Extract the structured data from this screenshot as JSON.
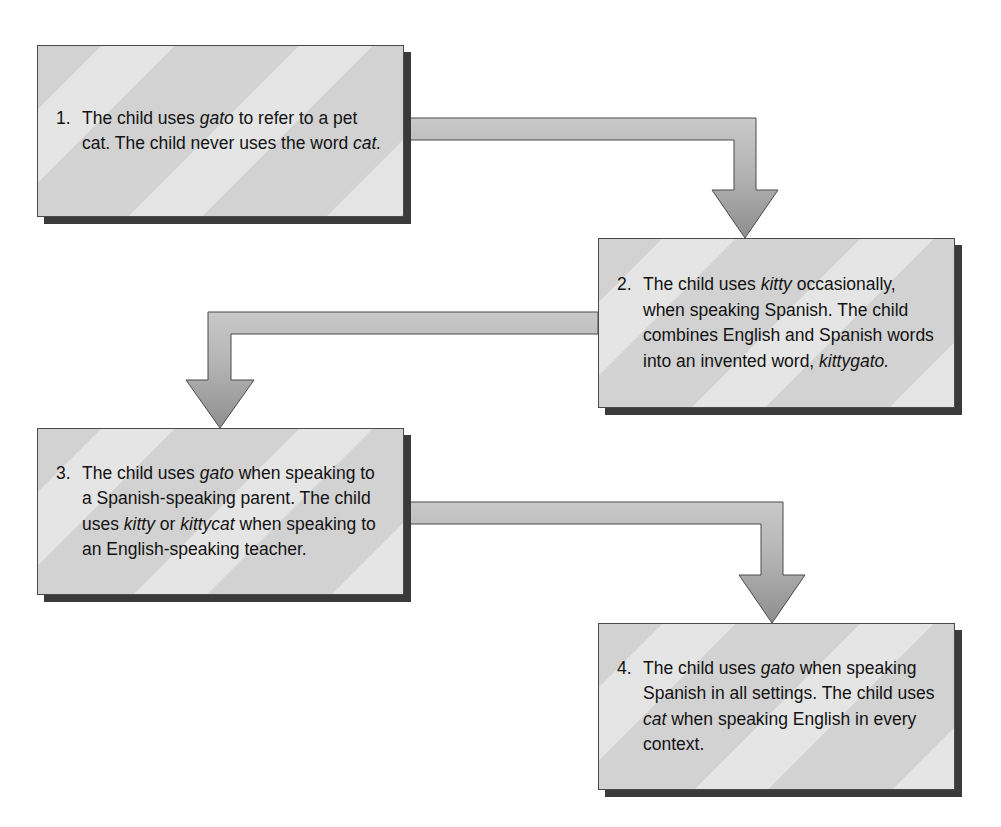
{
  "diagram": {
    "type": "linear-flowchart",
    "direction": "top-left to bottom-right, serpentine",
    "colors": {
      "box_fill": "#d2d2d2",
      "box_stripe_light": "#e4e4e4",
      "box_border": "#4a4a4a",
      "box_shadow": "#3a3a3a",
      "arrow_fill_light": "#d0d0d0",
      "arrow_fill_dark": "#9a9a9a",
      "arrow_border": "#4a4a4a",
      "text": "#121212",
      "background": "#ffffff"
    },
    "steps": [
      {
        "number": "1.",
        "text_plain": "The child uses gato to refer to a pet cat. The child never uses the word cat.",
        "text_html": "The child uses <em>gato</em> to refer to a pet cat. The child never uses the word <em>cat.</em>"
      },
      {
        "number": "2.",
        "text_plain": "The child uses kitty occasionally, when speaking Spanish. The child combines English and Spanish words into an invented word, kittygato.",
        "text_html": "The child uses <em>kitty</em> occasionally, when speaking Spanish. The child combines English and Spanish words into an invented word, <em>kittygato.</em>"
      },
      {
        "number": "3.",
        "text_plain": "The child uses gato when speaking to a Spanish-speaking parent. The child uses kitty or kittycat when speaking to an English-speaking teacher.",
        "text_html": "The child uses <em>gato</em> when speaking to a Spanish-speaking parent. The child uses <em>kitty</em> or <em>kittycat</em> when speaking to an English-speaking teacher."
      },
      {
        "number": "4.",
        "text_plain": "The child uses gato when speaking Spanish in all settings. The child uses cat when speaking English in every context.",
        "text_html": "The child uses <em>gato</em> when speaking Spanish in all settings. The child uses <em>cat</em> when speaking English in every context."
      }
    ],
    "connectors": [
      {
        "from": "1",
        "to": "2",
        "shape": "right-then-down",
        "arrowhead": "down"
      },
      {
        "from": "2",
        "to": "3",
        "shape": "left-then-down",
        "arrowhead": "down"
      },
      {
        "from": "3",
        "to": "4",
        "shape": "right-then-down",
        "arrowhead": "down"
      }
    ]
  }
}
